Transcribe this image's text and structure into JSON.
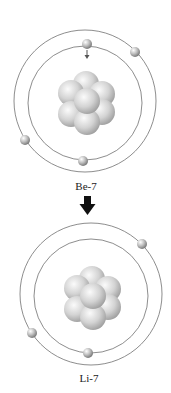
{
  "diagram": {
    "top_atom": {
      "label": "Be-7",
      "center": [
        85,
        101
      ],
      "outer_radius": 71,
      "inner_radius": 57,
      "electrons": [
        {
          "orbit": "inner",
          "pos": [
            87,
            44
          ]
        },
        {
          "orbit": "inner",
          "pos": [
            83,
            161
          ]
        },
        {
          "orbit": "outer",
          "pos": [
            135,
            52
          ]
        },
        {
          "orbit": "outer",
          "pos": [
            25,
            140
          ]
        }
      ],
      "capture_arrow": "electron-capture-arrow"
    },
    "transition_arrow": "down-arrow",
    "bottom_atom": {
      "label": "Li-7",
      "center": [
        91,
        294
      ],
      "outer_radius": 71,
      "inner_radius": 57,
      "electrons": [
        {
          "orbit": "inner",
          "pos": [
            88,
            352
          ]
        },
        {
          "orbit": "outer",
          "pos": [
            142,
            244
          ]
        },
        {
          "orbit": "outer",
          "pos": [
            32,
            333
          ]
        }
      ]
    },
    "colors": {
      "orbit": "#6e6e6e",
      "nucleon": "#d0d0d0",
      "nucleon_shadow": "#9a9a9a",
      "electron": "#b8b8b8",
      "arrow": "#111111"
    }
  }
}
